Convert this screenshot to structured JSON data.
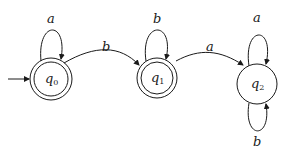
{
  "diagram": {
    "type": "DFA",
    "states": [
      {
        "id": "q0",
        "name": "q",
        "sub": "0",
        "accepting": true,
        "initial": true
      },
      {
        "id": "q1",
        "name": "q",
        "sub": "1",
        "accepting": true,
        "initial": false
      },
      {
        "id": "q2",
        "name": "q",
        "sub": "2",
        "accepting": false,
        "initial": false
      }
    ],
    "transitions": [
      {
        "from": "q0",
        "to": "q0",
        "label": "a"
      },
      {
        "from": "q0",
        "to": "q1",
        "label": "b"
      },
      {
        "from": "q1",
        "to": "q1",
        "label": "b"
      },
      {
        "from": "q1",
        "to": "q2",
        "label": "a"
      },
      {
        "from": "q2",
        "to": "q2",
        "label": "a"
      },
      {
        "from": "q2",
        "to": "q2",
        "label": "b"
      }
    ],
    "colors": {
      "stroke": "#1a1a1a",
      "background": "#ffffff"
    }
  }
}
